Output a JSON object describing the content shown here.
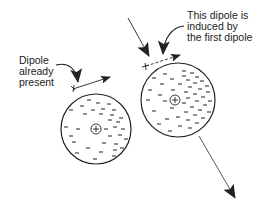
{
  "diagram": {
    "labels": {
      "left": {
        "lines": [
          "Dipole",
          "already",
          "present"
        ]
      },
      "right": {
        "lines": [
          "This dipole is",
          "induced by",
          "the first dipole"
        ]
      }
    },
    "atoms": [
      {
        "name": "atom-with-existing-dipole",
        "center": [
          96,
          129
        ],
        "radius": 35,
        "nucleus_symbol": "+",
        "electron_symbol": "−",
        "electron_distribution": "slightly skewed right"
      },
      {
        "name": "atom-with-induced-dipole",
        "center": [
          178,
          100
        ],
        "radius": 37,
        "nucleus_symbol": "+",
        "electron_symbol": "−",
        "electron_distribution": "concentrated on right side"
      }
    ],
    "dipole_arrows": [
      {
        "name": "existing-dipole-arrow",
        "style": "solid",
        "from": [
          73,
          88
        ],
        "to": [
          110,
          76
        ],
        "tail_symbol": "+"
      },
      {
        "name": "induced-dipole-arrow",
        "style": "dashed",
        "from": [
          145,
          66
        ],
        "to": [
          180,
          55
        ],
        "tail_symbol": "+"
      }
    ],
    "colors": {
      "stroke": "#222222",
      "background": "#ffffff"
    }
  }
}
